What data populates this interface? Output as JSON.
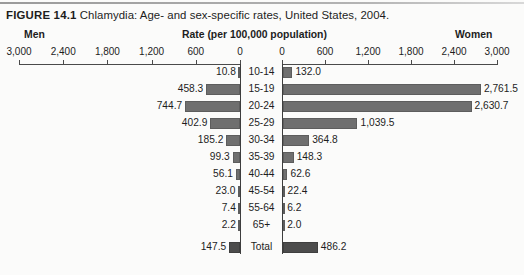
{
  "figure": {
    "number_label": "FIGURE 14.1",
    "caption": "Chlamydia: Age- and sex-specific rates, United States, 2004."
  },
  "headers": {
    "left": "Men",
    "center": "Rate (per 100,000 population)",
    "right": "Women"
  },
  "axis": {
    "left_ticks": [
      "3,000",
      "2,400",
      "1,800",
      "1,200",
      "600",
      "0"
    ],
    "right_ticks": [
      "0",
      "600",
      "1,200",
      "1,800",
      "2,400",
      "3,000"
    ],
    "max": 3000,
    "tick_step": 600
  },
  "colors": {
    "bar": "#6f6f6f",
    "bar_total": "#4c4c4c",
    "axis": "#3d3d3d",
    "background": "#fbfbfa",
    "text": "#1d1d1d"
  },
  "chart_data": {
    "type": "bar",
    "title": "Chlamydia: Age- and sex-specific rates, United States, 2004.",
    "subtitle": "FIGURE 14.1",
    "xlabel": "Rate (per 100,000 population)",
    "ylabel": "Age group (years)",
    "orientation": "horizontal",
    "layout": "population-pyramid",
    "grid": false,
    "legend_position": "top",
    "xlim": [
      0,
      3000
    ],
    "xticks": [
      0,
      600,
      1200,
      1800,
      2400,
      3000
    ],
    "categories": [
      "10-14",
      "15-19",
      "20-24",
      "25-29",
      "30-34",
      "35-39",
      "40-44",
      "45-54",
      "55-64",
      "65+",
      "Total"
    ],
    "series": [
      {
        "name": "Men",
        "side": "left",
        "values": [
          10.8,
          458.3,
          744.7,
          402.9,
          185.2,
          99.3,
          56.1,
          23.0,
          7.4,
          2.2,
          147.5
        ],
        "labels": [
          "10.8",
          "458.3",
          "744.7",
          "402.9",
          "185.2",
          "99.3",
          "56.1",
          "23.0",
          "7.4",
          "2.2",
          "147.5"
        ]
      },
      {
        "name": "Women",
        "side": "right",
        "values": [
          132.0,
          2761.5,
          2630.7,
          1039.5,
          364.8,
          148.3,
          62.6,
          22.4,
          6.2,
          2.0,
          486.2
        ],
        "labels": [
          "132.0",
          "2,761.5",
          "2,630.7",
          "1,039.5",
          "364.8",
          "148.3",
          "62.6",
          "22.4",
          "6.2",
          "2.0",
          "486.2"
        ]
      }
    ]
  }
}
